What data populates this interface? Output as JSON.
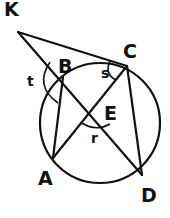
{
  "diagram": {
    "type": "geometry",
    "circle": {
      "center": [
        100,
        123
      ],
      "radius": 60
    },
    "points": {
      "K": {
        "label": "K",
        "x": 18,
        "y": 32
      },
      "B": {
        "label": "B",
        "x": 63,
        "y": 77
      },
      "C": {
        "label": "C",
        "x": 127,
        "y": 66
      },
      "E": {
        "label": "E",
        "x": 95,
        "y": 110
      },
      "A": {
        "label": "A",
        "x": 53,
        "y": 158
      },
      "D": {
        "label": "D",
        "x": 142,
        "y": 175
      }
    },
    "segments": [
      [
        "K",
        "C"
      ],
      [
        "K",
        "D"
      ],
      [
        "B",
        "A"
      ],
      [
        "C",
        "A"
      ],
      [
        "C",
        "D"
      ]
    ],
    "angle_labels": {
      "t": {
        "label": "t",
        "at": "B"
      },
      "s": {
        "label": "s",
        "at": "C"
      },
      "r": {
        "label": "r",
        "at": "E"
      }
    }
  }
}
